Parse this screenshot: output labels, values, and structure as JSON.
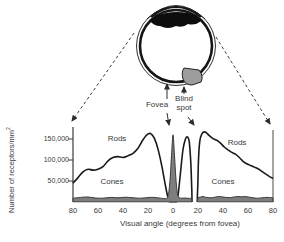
{
  "figure": {
    "eye": {
      "fovea_label": "Fovea",
      "blind_spot_label": {
        "line1": "Blind",
        "line2": "spot"
      }
    },
    "curve_labels": {
      "rods_left": "Rods",
      "rods_right": "Rods",
      "cones_left": "Cones",
      "cones_right": "Cones"
    },
    "colors": {
      "line": "#1a1a1a",
      "cones_fill": "#7e7e7e",
      "cones_stroke": "#3a3a3a",
      "optic_disc_fill": "#9d9d9d",
      "text": "#3a3a3a"
    }
  },
  "chart_data": {
    "type": "line",
    "title": "",
    "xlabel": "Visual angle (degrees from fovea)",
    "ylabel": "Number of receptors/mm²",
    "ylabel_main": "Number of receptors/mm",
    "ylabel_sup": "2",
    "units": "values in thousands of receptors per mm²",
    "xlim": [
      -80,
      80
    ],
    "ylim_k": [
      0,
      175
    ],
    "x_ticks_deg": [
      -80,
      -60,
      -40,
      -20,
      0,
      20,
      40,
      60,
      80
    ],
    "x_tick_labels": [
      "80",
      "60",
      "40",
      "20",
      "0",
      "20",
      "40",
      "60",
      "80"
    ],
    "y_ticks_k": [
      50,
      100,
      150
    ],
    "y_tick_labels": [
      "50,000",
      "100,000",
      "150,000"
    ],
    "grid": false,
    "legend": "inline text labels on curves",
    "markers": {
      "fovea_deg": 0,
      "blind_spot_deg_range": [
        15.2,
        19.4
      ]
    },
    "series": [
      {
        "name": "Rods",
        "style": "line",
        "color": "#1a1a1a",
        "segments": [
          [
            [
              -80,
              45
            ],
            [
              -76,
              58
            ],
            [
              -72,
              72
            ],
            [
              -68,
              78
            ],
            [
              -64,
              76
            ],
            [
              -60,
              78
            ],
            [
              -56,
              84
            ],
            [
              -52,
              98
            ],
            [
              -48,
              106
            ],
            [
              -44,
              108
            ],
            [
              -40,
              106
            ],
            [
              -36,
              110
            ],
            [
              -32,
              116
            ],
            [
              -28,
              128
            ],
            [
              -24,
              148
            ],
            [
              -21,
              160
            ],
            [
              -18,
              163
            ],
            [
              -15,
              152
            ],
            [
              -12,
              126
            ],
            [
              -9,
              86
            ],
            [
              -6,
              38
            ],
            [
              -4,
              10
            ],
            [
              -2.8,
              0
            ],
            [
              2.8,
              0
            ],
            [
              4,
              15
            ],
            [
              6,
              70
            ],
            [
              8,
              125
            ],
            [
              10,
              150
            ],
            [
              11.5,
              155
            ],
            [
              13,
              143
            ],
            [
              14.2,
              95
            ],
            [
              15,
              30
            ],
            [
              15.2,
              0
            ]
          ],
          [
            [
              19.4,
              0
            ],
            [
              19.8,
              40
            ],
            [
              20.4,
              100
            ],
            [
              21.4,
              145
            ],
            [
              23,
              162
            ],
            [
              25,
              167
            ],
            [
              27,
              164
            ],
            [
              29,
              158
            ],
            [
              32,
              151
            ],
            [
              35,
              147
            ],
            [
              38,
              140
            ],
            [
              41,
              131
            ],
            [
              44,
              124
            ],
            [
              47,
              118
            ],
            [
              50,
              114
            ],
            [
              53,
              106
            ],
            [
              56,
              97
            ],
            [
              59,
              91
            ],
            [
              62,
              87
            ],
            [
              65,
              83
            ],
            [
              68,
              79
            ],
            [
              71,
              73
            ],
            [
              74,
              67
            ],
            [
              77,
              61
            ],
            [
              80,
              56
            ]
          ]
        ]
      },
      {
        "name": "Cones",
        "style": "area",
        "fill": "#7e7e7e",
        "stroke": "#3a3a3a",
        "segments": [
          [
            [
              -80,
              9
            ],
            [
              -74,
              11
            ],
            [
              -68,
              12
            ],
            [
              -62,
              9.5
            ],
            [
              -56,
              9
            ],
            [
              -50,
              11
            ],
            [
              -44,
              10
            ],
            [
              -38,
              11.5
            ],
            [
              -32,
              10
            ],
            [
              -26,
              9
            ],
            [
              -20,
              10.5
            ],
            [
              -15,
              11
            ],
            [
              -10,
              9
            ],
            [
              -7,
              8
            ],
            [
              -5,
              9
            ],
            [
              -3.5,
              20
            ],
            [
              -2.2,
              60
            ],
            [
              -1.2,
              110
            ],
            [
              0,
              160
            ],
            [
              1.2,
              110
            ],
            [
              2.2,
              60
            ],
            [
              3.5,
              20
            ],
            [
              5,
              11
            ],
            [
              7,
              9
            ],
            [
              9,
              9.5
            ],
            [
              11,
              9
            ],
            [
              13,
              8.5
            ],
            [
              14.5,
              8
            ],
            [
              15.2,
              0
            ]
          ],
          [
            [
              19.4,
              0
            ],
            [
              20,
              9
            ],
            [
              22,
              12
            ],
            [
              24,
              13
            ],
            [
              26,
              11.5
            ],
            [
              28,
              10.5
            ],
            [
              31,
              10
            ],
            [
              34,
              12
            ],
            [
              37,
              13
            ],
            [
              40,
              12
            ],
            [
              43,
              10.5
            ],
            [
              46,
              10.5
            ],
            [
              49,
              12
            ],
            [
              52,
              13
            ],
            [
              55,
              12.5
            ],
            [
              58,
              13
            ],
            [
              61,
              11.5
            ],
            [
              64,
              10
            ],
            [
              67,
              9
            ],
            [
              70,
              9.5
            ],
            [
              73,
              10.5
            ],
            [
              76,
              11
            ],
            [
              80,
              10
            ]
          ]
        ]
      }
    ]
  }
}
